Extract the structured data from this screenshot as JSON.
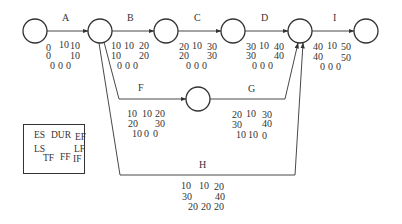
{
  "diagram": {
    "type": "activity-on-arrow network",
    "nodes": [
      {
        "id": "n1",
        "cx": 35,
        "cy": 31
      },
      {
        "id": "n2",
        "cx": 100,
        "cy": 31
      },
      {
        "id": "n3",
        "cx": 166,
        "cy": 31
      },
      {
        "id": "n4",
        "cx": 233,
        "cy": 31
      },
      {
        "id": "n5",
        "cx": 300,
        "cy": 31
      },
      {
        "id": "n6",
        "cx": 366,
        "cy": 31
      },
      {
        "id": "n7",
        "cx": 198,
        "cy": 99
      }
    ],
    "activities": {
      "A": {
        "name": "A",
        "es": "0",
        "dur": "10",
        "ef": "10",
        "ls": "0",
        "lf": "10",
        "tf": "0",
        "ff": "0",
        "if": "0"
      },
      "B": {
        "name": "B",
        "es": "10",
        "dur": "10",
        "ef": "20",
        "ls": "10",
        "lf": "20",
        "tf": "0",
        "ff": "0",
        "if": "0"
      },
      "C": {
        "name": "C",
        "es": "20",
        "dur": "10",
        "ef": "30",
        "ls": "20",
        "lf": "30",
        "tf": "0",
        "ff": "0",
        "if": "0"
      },
      "D": {
        "name": "D",
        "es": "30",
        "dur": "10",
        "ef": "40",
        "ls": "30",
        "lf": "40",
        "tf": "0",
        "ff": "0",
        "if": "0"
      },
      "I": {
        "name": "I",
        "es": "40",
        "dur": "10",
        "ef": "50",
        "ls": "40",
        "lf": "50",
        "tf": "0",
        "ff": "0",
        "if": "0"
      },
      "F": {
        "name": "F",
        "es": "10",
        "dur": "10",
        "ef": "20",
        "ls": "20",
        "lf": "30",
        "tf": "10",
        "ff": "0",
        "if": "0"
      },
      "G": {
        "name": "G",
        "es": "20",
        "dur": "10",
        "ef": "30",
        "ls": "30",
        "lf": "40",
        "tf": "10",
        "ff": "10",
        "if": "0"
      },
      "H": {
        "name": "H",
        "es": "10",
        "dur": "10",
        "ef": "20",
        "ls": "30",
        "lf": "40",
        "tf": "20",
        "ff": "20",
        "if": "20"
      }
    },
    "legend": {
      "es": "ES",
      "dur": "DUR",
      "ef": "EF",
      "ls": "LS",
      "lf": "LF",
      "tf": "TF",
      "ff": "FF",
      "if": "IF"
    }
  }
}
